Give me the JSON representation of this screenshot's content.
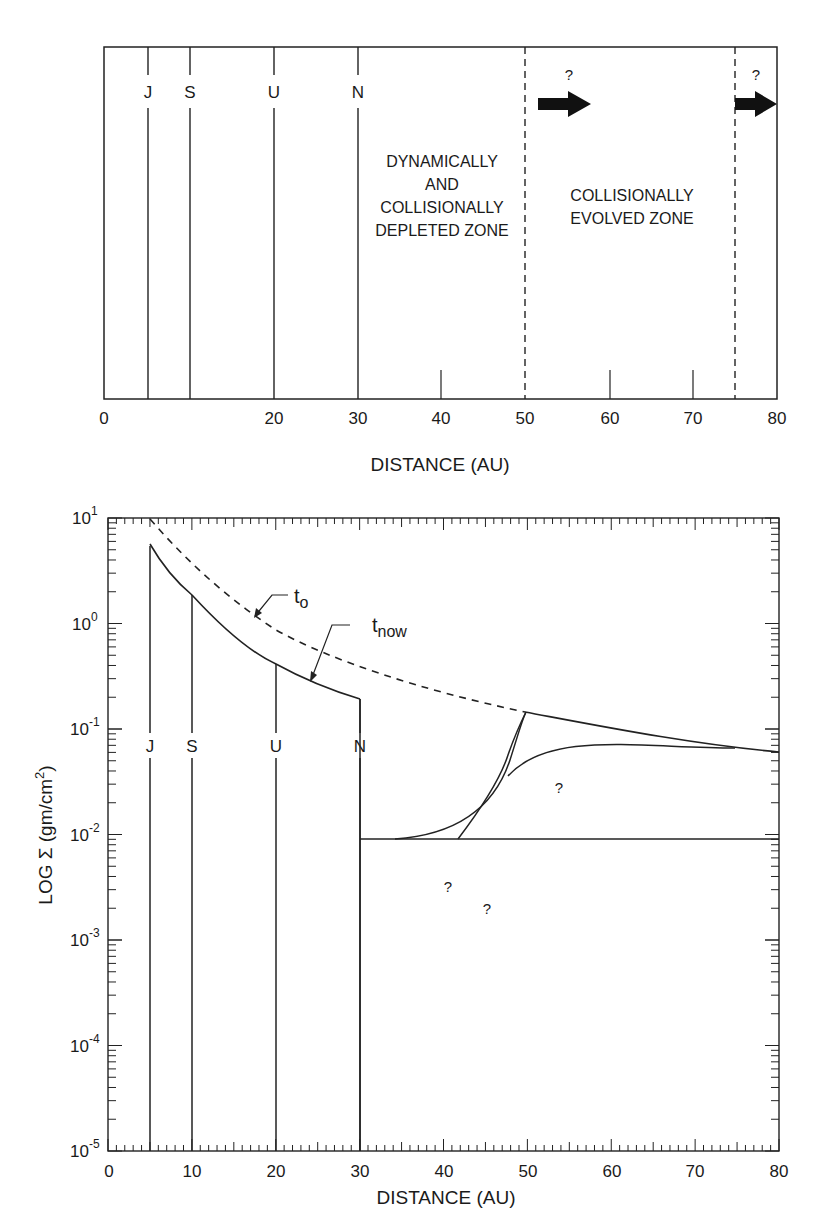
{
  "top_panel": {
    "planets": [
      {
        "label": "J",
        "x": 5
      },
      {
        "label": "S",
        "x": 10
      },
      {
        "label": "U",
        "x": 20
      },
      {
        "label": "N",
        "x": 30
      }
    ],
    "zones": {
      "depleted": [
        "DYNAMICALLY",
        "AND",
        "COLLISIONALLY",
        "DEPLETED ZONE"
      ],
      "evolved": [
        "COLLISIONALLY",
        "EVOLVED ZONE"
      ]
    },
    "boundaries_dashed": [
      50,
      75
    ],
    "arrow_question": "?",
    "x_ticks": [
      "0",
      "20",
      "30",
      "40",
      "50",
      "60",
      "70",
      "80"
    ],
    "x_label": "DISTANCE (AU)"
  },
  "bottom_panel": {
    "y_ticks": [
      "10",
      "10",
      "10",
      "10",
      "10",
      "10",
      "10"
    ],
    "y_exponents": [
      "1",
      "0",
      "-1",
      "-2",
      "-3",
      "-4",
      "-5"
    ],
    "y_label": "LOG Σ (gm/cm",
    "y_label_sup": "2",
    "y_label_end": ")",
    "x_ticks": [
      "0",
      "10",
      "20",
      "30",
      "40",
      "50",
      "60",
      "70",
      "80"
    ],
    "x_label": "DISTANCE (AU)",
    "curve_labels": {
      "t0_main": "t",
      "t0_sub": "o",
      "tnow_main": "t",
      "tnow_sub": "now"
    },
    "planets": [
      "J",
      "S",
      "U",
      "N"
    ],
    "question_marks": [
      "?",
      "?",
      "?"
    ]
  },
  "chart_data": [
    {
      "type": "line",
      "title": "",
      "xlabel": "DISTANCE (AU)",
      "ylabel": "",
      "xlim": [
        0,
        80
      ],
      "x_ticks": [
        0,
        20,
        30,
        40,
        50,
        60,
        70,
        80
      ],
      "planet_markers": {
        "J": 5,
        "S": 10,
        "U": 20,
        "N": 30
      },
      "zone_boundaries": [
        {
          "x": 50,
          "style": "dashed"
        },
        {
          "x": 75,
          "style": "dashed"
        }
      ],
      "annotations": [
        {
          "text": "DYNAMICALLY AND COLLISIONALLY DEPLETED ZONE",
          "x_range": [
            30,
            50
          ]
        },
        {
          "text": "COLLISIONALLY EVOLVED ZONE",
          "x_range": [
            50,
            75
          ]
        },
        {
          "text": "? (arrow right)",
          "x": 52
        },
        {
          "text": "? (arrow right)",
          "x": 76
        }
      ]
    },
    {
      "type": "line",
      "title": "",
      "xlabel": "DISTANCE (AU)",
      "ylabel": "LOG Σ (gm/cm²)",
      "yscale": "log",
      "xlim": [
        0,
        80
      ],
      "ylim": [
        1e-05,
        10
      ],
      "x_ticks": [
        0,
        10,
        20,
        30,
        40,
        50,
        60,
        70,
        80
      ],
      "y_ticks": [
        1e-05,
        0.0001,
        0.001,
        0.01,
        0.1,
        1,
        10
      ],
      "series": [
        {
          "name": "t_o (initial, dashed)",
          "x": [
            5,
            10,
            20,
            30,
            40,
            50
          ],
          "y": [
            10,
            3.5,
            1.0,
            0.45,
            0.22,
            0.12
          ]
        },
        {
          "name": "t_now (inner disk)",
          "x": [
            5,
            10,
            20,
            30
          ],
          "y": [
            5.5,
            1.5,
            0.38,
            0.17
          ]
        },
        {
          "name": "outer envelope",
          "x": [
            50,
            60,
            70,
            80
          ],
          "y": [
            0.12,
            0.085,
            0.062,
            0.05
          ]
        },
        {
          "name": "floor",
          "x": [
            30,
            80
          ],
          "y": [
            0.00057,
            0.00057
          ]
        },
        {
          "name": "? curve A",
          "x": [
            35,
            40,
            45,
            48,
            50
          ],
          "y": [
            0.00058,
            0.0009,
            0.003,
            0.012,
            0.12
          ]
        },
        {
          "name": "? curve B",
          "x": [
            42,
            45,
            48,
            50
          ],
          "y": [
            0.00057,
            0.0015,
            0.006,
            0.12
          ]
        },
        {
          "name": "? curve C",
          "x": [
            42,
            47,
            55,
            65,
            75
          ],
          "y": [
            0.00057,
            0.004,
            0.02,
            0.045,
            0.057
          ]
        }
      ],
      "planet_markers": {
        "J": 5,
        "S": 10,
        "U": 20,
        "N": 30
      }
    }
  ]
}
